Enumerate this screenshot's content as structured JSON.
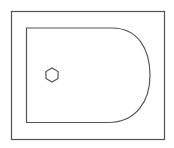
{
  "diagram": {
    "width": 174,
    "height": 148,
    "stroke_color": "#555555",
    "background": "#ffffff",
    "outer_rect": {
      "x": 11.5,
      "y": 11.5,
      "w": 153,
      "h": 128
    },
    "inner_shape": {
      "left": 26.5,
      "top": 28,
      "bottom": 122.5,
      "arc_start_x": 112,
      "arc_end_x": 108,
      "arc_right_x": 150
    },
    "hole": {
      "cx": 52,
      "cy": 75,
      "r": 7
    }
  }
}
